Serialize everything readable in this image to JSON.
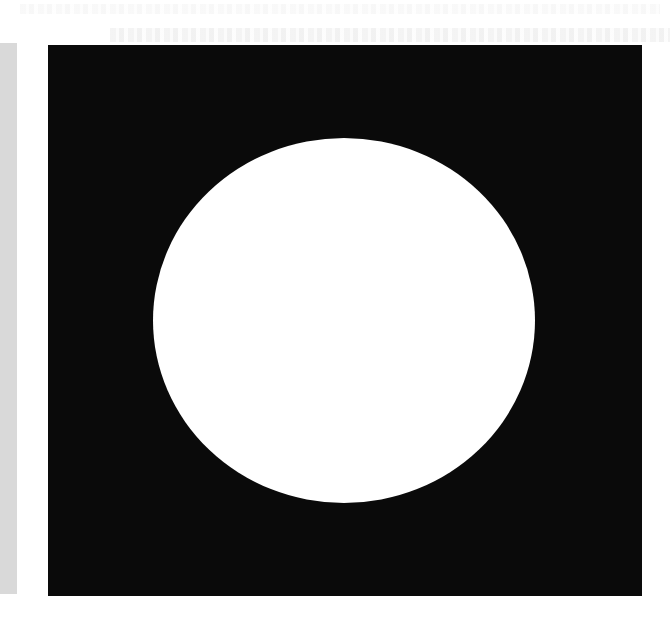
{
  "page": {
    "background": "#ffffff",
    "margin_strip_color": "#d9d9d9"
  },
  "figure": {
    "shape_outer": "square",
    "outer_color": "#0a0a0a",
    "shape_inner": "circle",
    "inner_color": "#ffffff"
  }
}
